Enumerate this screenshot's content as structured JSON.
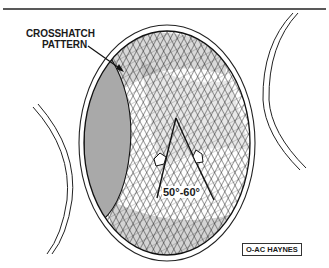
{
  "figure": {
    "callout": {
      "line1": "CROSSHATCH",
      "line2": "PATTERN"
    },
    "angle_label": "50°-60°",
    "credit": "O-AC HAYNES"
  },
  "colors": {
    "ink": "#1a1a1a",
    "shaded_wall": "#a9a9a9",
    "background": "#ffffff"
  }
}
